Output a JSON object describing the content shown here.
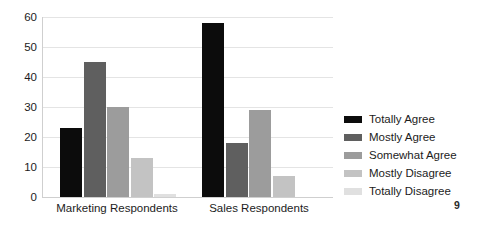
{
  "page": {
    "background": "#ffffff",
    "page_number": "9"
  },
  "chart_data": {
    "type": "bar",
    "title": "",
    "xlabel": "",
    "ylabel": "",
    "categories": [
      "Marketing Respondents",
      "Sales Respondents"
    ],
    "series": [
      {
        "name": "Totally Agree",
        "color": "#0c0c0c",
        "values": [
          23,
          58
        ]
      },
      {
        "name": "Mostly Agree",
        "color": "#5f5f5f",
        "values": [
          45,
          18
        ]
      },
      {
        "name": "Somewhat Agree",
        "color": "#9c9c9c",
        "values": [
          30,
          29
        ]
      },
      {
        "name": "Mostly Disagree",
        "color": "#c3c3c3",
        "values": [
          13,
          7
        ]
      },
      {
        "name": "Totally Disagree",
        "color": "#e0e0e0",
        "values": [
          1,
          0
        ]
      }
    ],
    "ylim": [
      0,
      60
    ],
    "yticks": [
      0,
      10,
      20,
      30,
      40,
      50,
      60
    ],
    "grid": true,
    "legend_position": "right"
  },
  "colors": {
    "gridline": "#e4e4e4",
    "axis_line": "#cfcfcf",
    "text": "#1c1c1c"
  }
}
